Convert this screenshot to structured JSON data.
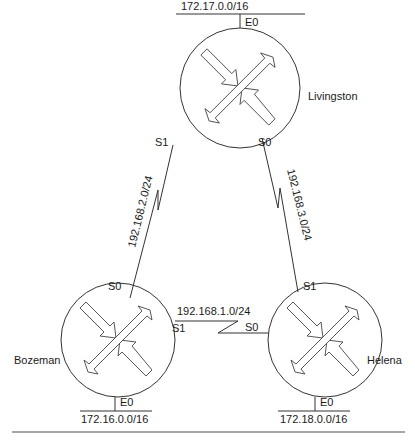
{
  "diagram": {
    "routers": [
      {
        "name": "Livingston",
        "cx": 240,
        "cy": 88,
        "r": 60,
        "label_x": 308,
        "label_y": 100
      },
      {
        "name": "Bozeman",
        "cx": 118,
        "cy": 340,
        "r": 57,
        "label_x": 14,
        "label_y": 364
      },
      {
        "name": "Helena",
        "cx": 325,
        "cy": 340,
        "r": 57,
        "label_x": 367,
        "label_y": 364
      }
    ],
    "lans": [
      {
        "router": "Livingston",
        "interface": "E0",
        "network": "172.17.0.0/16"
      },
      {
        "router": "Bozeman",
        "interface": "E0",
        "network": "172.16.0.0/16"
      },
      {
        "router": "Helena",
        "interface": "E0",
        "network": "172.18.0.0/16"
      }
    ],
    "serial_links": [
      {
        "from": "Livingston",
        "from_interface": "S1",
        "to": "Bozeman",
        "to_interface": "S0",
        "network": "192.168.2.0/24"
      },
      {
        "from": "Livingston",
        "from_interface": "S0",
        "to": "Helena",
        "to_interface": "S1",
        "network": "192.168.3.0/24"
      },
      {
        "from": "Bozeman",
        "from_interface": "S1",
        "to": "Helena",
        "to_interface": "S0",
        "network": "192.168.1.0/24"
      }
    ]
  },
  "labels": {
    "livingston": "Livingston",
    "bozeman": "Bozeman",
    "helena": "Helena",
    "liv_e0": "E0",
    "liv_s1": "S1",
    "liv_s0": "S0",
    "boz_s0": "S0",
    "boz_s1": "S1",
    "boz_e0": "E0",
    "hel_s1": "S1",
    "hel_s0": "S0",
    "hel_e0": "E0",
    "net_liv_lan": "172.17.0.0/16",
    "net_boz_lan": "172.16.0.0/16",
    "net_hel_lan": "172.18.0.0/16",
    "net_liv_boz": "192.168.2.0/24",
    "net_liv_hel": "192.168.3.0/24",
    "net_boz_hel": "192.168.1.0/24"
  }
}
